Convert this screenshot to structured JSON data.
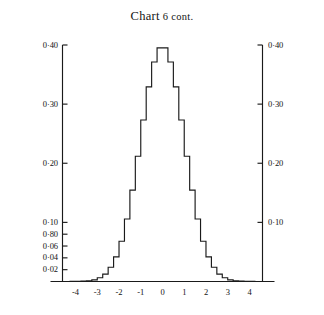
{
  "title": "Chart 6 cont.",
  "title_parts": {
    "word": "Chart",
    "rest": " 6 cont."
  },
  "chart_data": {
    "type": "bar",
    "title": "Chart 6 cont.",
    "xlabel": "",
    "ylabel": "",
    "subtitle": "",
    "grid": false,
    "legend": "none",
    "xlim": [
      -4.6,
      4.6
    ],
    "ylim": [
      0,
      0.4
    ],
    "bin_width": 0.25,
    "x_tick_values": [
      -4,
      -3,
      -2,
      -1,
      0,
      1,
      2,
      3,
      4
    ],
    "x_tick_labels": [
      "-4",
      "-3",
      "-2",
      "-1",
      "0",
      "1",
      "2",
      "3",
      "4"
    ],
    "y_tick_values_left": [
      0.02,
      0.04,
      0.06,
      0.08,
      0.1,
      0.2,
      0.3,
      0.4
    ],
    "y_tick_labels_left": [
      "0·02",
      "0·04",
      "0·06",
      "0·80",
      "0·10",
      "0·20",
      "0·30",
      "0·40"
    ],
    "y_tick_values_right": [
      0.1,
      0.2,
      0.3,
      0.4
    ],
    "y_tick_labels_right": [
      "0·10",
      "0·20",
      "0·30",
      "0·40"
    ],
    "bin_centers": [
      -4.375,
      -4.125,
      -3.875,
      -3.625,
      -3.375,
      -3.125,
      -2.875,
      -2.625,
      -2.375,
      -2.125,
      -1.875,
      -1.625,
      -1.375,
      -1.125,
      -0.875,
      -0.625,
      -0.375,
      -0.125,
      0.125,
      0.375,
      0.625,
      0.875,
      1.125,
      1.375,
      1.625,
      1.875,
      2.125,
      2.375,
      2.625,
      2.875,
      3.125,
      3.375,
      3.625,
      3.875,
      4.125,
      4.375
    ],
    "values": [
      0.0,
      0.0001,
      0.0002,
      0.0006,
      0.0013,
      0.0027,
      0.0063,
      0.0126,
      0.0241,
      0.0417,
      0.0681,
      0.1057,
      0.1545,
      0.2119,
      0.2732,
      0.3292,
      0.3712,
      0.3952,
      0.3952,
      0.3712,
      0.3292,
      0.2732,
      0.2119,
      0.1545,
      0.1057,
      0.0681,
      0.0417,
      0.0241,
      0.0126,
      0.0063,
      0.0027,
      0.0013,
      0.0006,
      0.0002,
      0.0001,
      0.0
    ],
    "line_color": "#1a1a1a",
    "background_color": "#ffffff"
  },
  "axes": {
    "left_axis_name": "left-value-axis",
    "right_axis_name": "right-value-axis",
    "bottom_axis_name": "category-axis"
  }
}
